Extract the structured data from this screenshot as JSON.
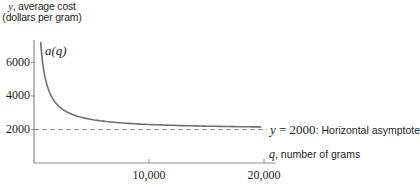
{
  "chart_data": {
    "type": "line",
    "title": "",
    "xlabel": "q, number of grams",
    "ylabel": "y, average cost (dollars per gram)",
    "xlabel_var": "q",
    "xlabel_text": ", number of grams",
    "ylabel_var": "y",
    "ylabel_line1": ", average cost",
    "ylabel_line2": "(dollars per gram)",
    "x_ticks": [
      10000,
      20000
    ],
    "x_tick_labels": [
      "10,000",
      "20,000"
    ],
    "y_ticks": [
      2000,
      4000,
      6000
    ],
    "y_tick_labels": [
      "2000",
      "4000",
      "6000"
    ],
    "xlim": [
      0,
      21000
    ],
    "ylim": [
      0,
      7300
    ],
    "grid": false,
    "series": [
      {
        "name": "a(q)",
        "style": "solid",
        "color": "#6d6e71",
        "formula": "2000 + 3000000/q",
        "x": [
          420,
          500,
          600,
          800,
          1000,
          1400,
          2000,
          3000,
          4000,
          6000,
          8000,
          10000,
          12000,
          15000,
          18000,
          20000
        ],
        "values": [
          9143,
          8000,
          7000,
          5750,
          5000,
          4143,
          3500,
          3000,
          2750,
          2500,
          2375,
          2300,
          2250,
          2200,
          2167,
          2150
        ]
      },
      {
        "name": "y = 2000",
        "style": "dashed",
        "color": "#6d6e71",
        "x": [
          0,
          20000
        ],
        "values": [
          2000,
          2000
        ]
      }
    ],
    "annotations": [
      {
        "text": "a(q)",
        "x": 1100,
        "y": 6500
      },
      {
        "text": "y = 2000: Horizontal asymptote",
        "x": 20500,
        "y": 2000
      }
    ],
    "curve_label": "a(q)",
    "asymptote_eq_var": "y",
    "asymptote_eq_rest": " = 2000",
    "asymptote_desc": ": Horizontal asymptote"
  }
}
